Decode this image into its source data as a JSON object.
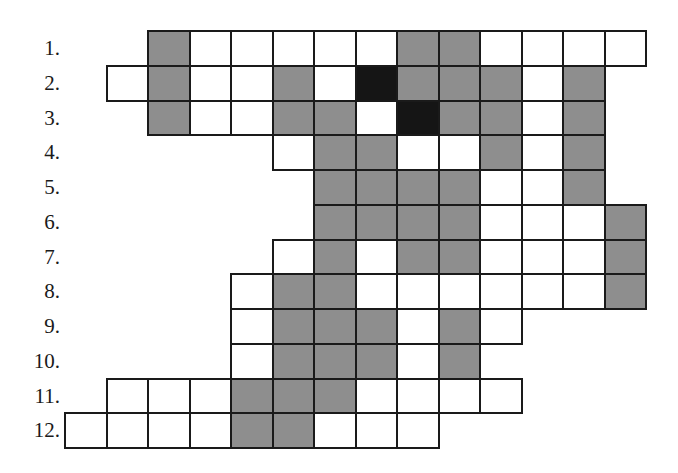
{
  "puzzle": {
    "type": "crossword-grid",
    "grid_origin": {
      "x": 64,
      "y": 30
    },
    "cell_width": 41.5,
    "cell_height": 34.75,
    "colors": {
      "white": "#ffffff",
      "gray": "#8e8e8e",
      "black": "#151515",
      "border": "#1a1a1a"
    },
    "legend": {
      "W": "white cell",
      "G": "gray (shaded) cell",
      "B": "black cell",
      ".": "no cell"
    },
    "rows": [
      {
        "label": "1.",
        "cells": "..GWWWWWGGWWWW"
      },
      {
        "label": "2.",
        "cells": ".WGWWGWBGGGWG."
      },
      {
        "label": "3.",
        "cells": "..GWWGGWBGGWG."
      },
      {
        "label": "4.",
        "cells": ".....WGGWWGWG."
      },
      {
        "label": "5.",
        "cells": "......GGGGWWG."
      },
      {
        "label": "6.",
        "cells": "......GGGGWWWG"
      },
      {
        "label": "7.",
        "cells": ".....WGWGGWWWG"
      },
      {
        "label": "8.",
        "cells": "....WGGWWWWWWG"
      },
      {
        "label": "9.",
        "cells": "....WGGGWGW..."
      },
      {
        "label": "10.",
        "cells": "....WGGGWG...."
      },
      {
        "label": "11.",
        "cells": ".WWWGGGWWWW..."
      },
      {
        "label": "12.",
        "cells": "WWWWGGWWW....."
      }
    ]
  }
}
